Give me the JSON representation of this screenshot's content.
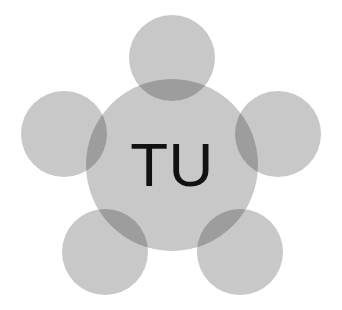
{
  "figure": {
    "name": "TU hub-and-satellite logo",
    "background_color": "#ffffff",
    "node_color": "#c8c8c8",
    "overlap_color": "#b4b4b4",
    "label_color": "#111111"
  },
  "center": {
    "label": "TU",
    "cx": 172,
    "cy": 165,
    "r": 86,
    "fill": "#c8c8c8"
  },
  "satellites": [
    {
      "id": "top",
      "label": "",
      "cx": 172,
      "cy": 58,
      "r": 43,
      "fill": "#c8c8c8"
    },
    {
      "id": "left",
      "label": "",
      "cx": 64,
      "cy": 134,
      "r": 43,
      "fill": "#c8c8c8"
    },
    {
      "id": "right",
      "label": "",
      "cx": 278,
      "cy": 134,
      "r": 43,
      "fill": "#c8c8c8"
    },
    {
      "id": "bottom-left",
      "label": "",
      "cx": 105,
      "cy": 252,
      "r": 43,
      "fill": "#c8c8c8"
    },
    {
      "id": "bottom-right",
      "label": "",
      "cx": 240,
      "cy": 252,
      "r": 43,
      "fill": "#c8c8c8"
    }
  ],
  "label_style": {
    "font_size": 62,
    "text_x": 172,
    "text_y": 186
  },
  "chart_data": {
    "type": "diagram",
    "title": "TU",
    "nodes": [
      {
        "name": "TU",
        "role": "hub",
        "radius": 86
      },
      {
        "name": "node-1",
        "role": "satellite",
        "radius": 43,
        "position": "top"
      },
      {
        "name": "node-2",
        "role": "satellite",
        "radius": 43,
        "position": "left"
      },
      {
        "name": "node-3",
        "role": "satellite",
        "radius": 43,
        "position": "right"
      },
      {
        "name": "node-4",
        "role": "satellite",
        "radius": 43,
        "position": "bottom-left"
      },
      {
        "name": "node-5",
        "role": "satellite",
        "radius": 43,
        "position": "bottom-right"
      }
    ],
    "edges": [
      {
        "from": "TU",
        "to": "node-1",
        "style": "overlap"
      },
      {
        "from": "TU",
        "to": "node-2",
        "style": "overlap"
      },
      {
        "from": "TU",
        "to": "node-3",
        "style": "overlap"
      },
      {
        "from": "TU",
        "to": "node-4",
        "style": "overlap"
      },
      {
        "from": "TU",
        "to": "node-5",
        "style": "overlap"
      }
    ]
  }
}
